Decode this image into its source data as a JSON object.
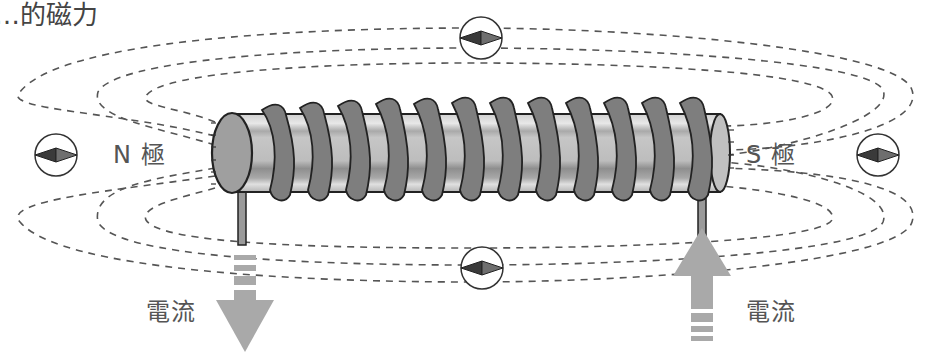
{
  "title": "…的磁力",
  "labels": {
    "north_pole": "N 極",
    "south_pole": "S 極",
    "current_left": "電流",
    "current_right": "電流"
  },
  "diagram": {
    "coil_turns": 12,
    "compasses": [
      {
        "position": "left",
        "needle": "pointing-left"
      },
      {
        "position": "top",
        "needle": "pointing-left"
      },
      {
        "position": "bottom",
        "needle": "pointing-left"
      },
      {
        "position": "right",
        "needle": "pointing-left"
      }
    ],
    "current_arrows": [
      {
        "position": "left-lead",
        "direction": "down"
      },
      {
        "position": "right-lead",
        "direction": "up"
      }
    ]
  },
  "colors": {
    "field_line": "#555555",
    "core": "#b8b8b8",
    "core_dark": "#8c8c8c",
    "core_light": "#e2e2e2",
    "coil": "#7a7a7a",
    "arrow": "#a9a9a9",
    "needle_dark": "#3a3a3a",
    "needle_light": "#6e6e6e",
    "text": "#555555"
  }
}
